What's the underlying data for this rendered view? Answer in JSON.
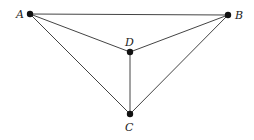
{
  "diagram": {
    "type": "graph",
    "nodes": [
      {
        "id": "A",
        "label": "A",
        "x": 30,
        "y": 14
      },
      {
        "id": "B",
        "label": "B",
        "x": 228,
        "y": 15
      },
      {
        "id": "D",
        "label": "D",
        "x": 130,
        "y": 52
      },
      {
        "id": "C",
        "label": "C",
        "x": 130,
        "y": 114
      }
    ],
    "edges": [
      [
        "A",
        "B"
      ],
      [
        "A",
        "D"
      ],
      [
        "A",
        "C"
      ],
      [
        "B",
        "D"
      ],
      [
        "B",
        "C"
      ],
      [
        "D",
        "C"
      ]
    ]
  }
}
